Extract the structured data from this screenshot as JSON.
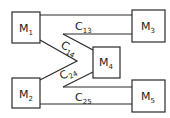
{
  "diagram": {
    "nodes": [
      {
        "id": "M1",
        "label": "M",
        "sub": "1"
      },
      {
        "id": "M2",
        "label": "M",
        "sub": "2"
      },
      {
        "id": "M3",
        "label": "M",
        "sub": "3"
      },
      {
        "id": "M4",
        "label": "M",
        "sub": "4"
      },
      {
        "id": "M5",
        "label": "M",
        "sub": "5"
      }
    ],
    "edges": [
      {
        "id": "C13",
        "label": "C",
        "sub": "13",
        "from": "M1",
        "to": "M3"
      },
      {
        "id": "C14",
        "label": "C",
        "sub": "14",
        "from": "M1",
        "to": "M4"
      },
      {
        "id": "C24",
        "label": "C",
        "sub": "24",
        "from": "M2",
        "to": "M4"
      },
      {
        "id": "C25",
        "label": "C",
        "sub": "25",
        "from": "M2",
        "to": "M5"
      }
    ],
    "colors": {
      "stroke": "#2a2a2a",
      "background": "#ffffff"
    }
  }
}
